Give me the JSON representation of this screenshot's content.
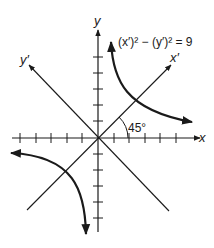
{
  "diagram": {
    "equation_label": "(x′)² − (y′)² = 9",
    "axes": {
      "x_label": "x",
      "y_label": "y",
      "x_prime_label": "x′",
      "y_prime_label": "y′"
    },
    "angle_label": "45°",
    "x_ticks_each_side": 5,
    "y_ticks_each_side": 5,
    "colors": {
      "line": "#1a1a1a",
      "background": "#ffffff"
    }
  }
}
